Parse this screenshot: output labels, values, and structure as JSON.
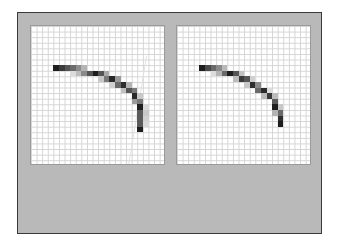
{
  "diagram": {
    "grid": {
      "cols": 24,
      "rows": 25,
      "cell_px": 5.6,
      "line_color": "#d4d4d4"
    },
    "colors": {
      "frame_bg": "#b9b9b9",
      "frame_border": "#3a3a3a",
      "panel_bg": "#ffffff"
    },
    "panels": [
      {
        "id": "left",
        "cells": [
          [
            4,
            7,
            "#1e1e1e"
          ],
          [
            5,
            7,
            "#3a3a3a"
          ],
          [
            6,
            7,
            "#555555"
          ],
          [
            7,
            7,
            "#6a6a6a"
          ],
          [
            8,
            7,
            "#8c8c8c"
          ],
          [
            9,
            7,
            "#b4b4b4"
          ],
          [
            7,
            8,
            "#dcdcdc"
          ],
          [
            8,
            8,
            "#bdbdbd"
          ],
          [
            9,
            8,
            "#8a8a8a"
          ],
          [
            10,
            8,
            "#555555"
          ],
          [
            11,
            8,
            "#1e1e1e"
          ],
          [
            12,
            8,
            "#555555"
          ],
          [
            13,
            8,
            "#aaaaaa"
          ],
          [
            12,
            9,
            "#c8c8c8"
          ],
          [
            13,
            9,
            "#7a7a7a"
          ],
          [
            14,
            9,
            "#2a2a2a"
          ],
          [
            15,
            9,
            "#9a9a9a"
          ],
          [
            14,
            10,
            "#d0d0d0"
          ],
          [
            15,
            10,
            "#6a6a6a"
          ],
          [
            16,
            10,
            "#2e2e2e"
          ],
          [
            17,
            10,
            "#b4b4b4"
          ],
          [
            16,
            11,
            "#c0c0c0"
          ],
          [
            17,
            11,
            "#555555"
          ],
          [
            18,
            11,
            "#7a7a7a"
          ],
          [
            18,
            12,
            "#2a2a2a"
          ],
          [
            19,
            12,
            "#c8c8c8"
          ],
          [
            18,
            13,
            "#9a9a9a"
          ],
          [
            19,
            13,
            "#7a7a7a"
          ],
          [
            19,
            14,
            "#1e1e1e"
          ],
          [
            20,
            14,
            "#d8d8d8"
          ],
          [
            19,
            15,
            "#5a5a5a"
          ],
          [
            20,
            15,
            "#c8c8c8"
          ],
          [
            19,
            16,
            "#5a5a5a"
          ],
          [
            20,
            16,
            "#d0d0d0"
          ],
          [
            19,
            17,
            "#5a5a5a"
          ],
          [
            20,
            17,
            "#d8d8d8"
          ],
          [
            19,
            18,
            "#1e1e1e"
          ]
        ],
        "guide_line": {
          "x1": 115,
          "y1": 30,
          "x2": 97,
          "y2": 140
        }
      },
      {
        "id": "right",
        "cells": [
          [
            4,
            7,
            "#1e1e1e"
          ],
          [
            5,
            7,
            "#4a4a4a"
          ],
          [
            6,
            7,
            "#6a6a6a"
          ],
          [
            7,
            7,
            "#8a8a8a"
          ],
          [
            8,
            7,
            "#b8b8b8"
          ],
          [
            6,
            8,
            "#dcdcdc"
          ],
          [
            7,
            8,
            "#b4b4b4"
          ],
          [
            8,
            8,
            "#6a6a6a"
          ],
          [
            9,
            8,
            "#1e1e1e"
          ],
          [
            10,
            8,
            "#555555"
          ],
          [
            11,
            8,
            "#c0c0c0"
          ],
          [
            10,
            9,
            "#bdbdbd"
          ],
          [
            11,
            9,
            "#3a3a3a"
          ],
          [
            12,
            9,
            "#555555"
          ],
          [
            13,
            9,
            "#d0d0d0"
          ],
          [
            12,
            10,
            "#c8c8c8"
          ],
          [
            13,
            10,
            "#2e2e2e"
          ],
          [
            14,
            10,
            "#8a8a8a"
          ],
          [
            14,
            11,
            "#6a6a6a"
          ],
          [
            15,
            11,
            "#2a2a2a"
          ],
          [
            16,
            11,
            "#dcdcdc"
          ],
          [
            15,
            12,
            "#b8b8b8"
          ],
          [
            16,
            12,
            "#3a3a3a"
          ],
          [
            17,
            12,
            "#bdbdbd"
          ],
          [
            17,
            13,
            "#5a5a5a"
          ],
          [
            17,
            14,
            "#1e1e1e"
          ],
          [
            18,
            14,
            "#c8c8c8"
          ],
          [
            17,
            15,
            "#b4b4b4"
          ],
          [
            18,
            15,
            "#6a6a6a"
          ],
          [
            18,
            16,
            "#2e2e2e"
          ],
          [
            18,
            17,
            "#1e1e1e"
          ]
        ]
      }
    ]
  }
}
